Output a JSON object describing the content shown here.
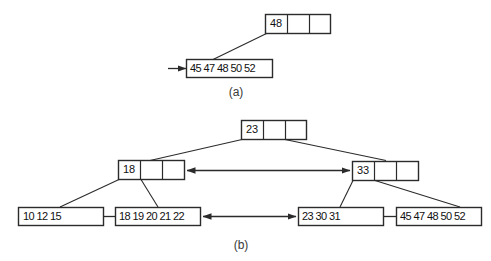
{
  "figure": {
    "background": "#ffffff",
    "line_color": "#2b2b2b",
    "text_color": "#111111",
    "caption_color": "#3a3a3a",
    "type": "b-plus-tree-diagram",
    "panels": [
      {
        "id": "a",
        "caption": "(a)",
        "levels": [
          {
            "role": "root",
            "nodes": [
              {
                "id": "a-root",
                "cells": [
                  "48",
                  "",
                  ""
                ],
                "keys": [
                  "48"
                ],
                "slots": 3
              }
            ]
          },
          {
            "role": "leaf",
            "nodes": [
              {
                "id": "a-leaf-1",
                "cells": [
                  "45",
                  "47",
                  "48",
                  "50",
                  "52"
                ],
                "keys": [
                  "45",
                  "47",
                  "48",
                  "50",
                  "52"
                ],
                "slots": 5,
                "inbound_arrow": "left"
              }
            ]
          }
        ],
        "edges": [
          {
            "from": "a-root",
            "from_slot": 0,
            "to": "a-leaf-1"
          }
        ]
      },
      {
        "id": "b",
        "caption": "(b)",
        "levels": [
          {
            "role": "root",
            "nodes": [
              {
                "id": "b-root",
                "cells": [
                  "23",
                  "",
                  ""
                ],
                "keys": [
                  "23"
                ],
                "slots": 3
              }
            ]
          },
          {
            "role": "internal",
            "nodes": [
              {
                "id": "b-internal-left",
                "cells": [
                  "18",
                  "",
                  ""
                ],
                "keys": [
                  "18"
                ],
                "slots": 3,
                "inbound_arrow": "right"
              },
              {
                "id": "b-internal-right",
                "cells": [
                  "33",
                  "",
                  ""
                ],
                "keys": [
                  "33"
                ],
                "slots": 3,
                "inbound_arrow": "left"
              }
            ]
          },
          {
            "role": "leaf",
            "nodes": [
              {
                "id": "b-leaf-1",
                "cells": [
                  "10",
                  "12",
                  "15"
                ],
                "keys": [
                  "10",
                  "12",
                  "15"
                ],
                "slots": 5
              },
              {
                "id": "b-leaf-2",
                "cells": [
                  "18",
                  "19",
                  "20",
                  "21",
                  "22"
                ],
                "keys": [
                  "18",
                  "19",
                  "20",
                  "21",
                  "22"
                ],
                "slots": 5,
                "inbound_arrow": "right"
              },
              {
                "id": "b-leaf-3",
                "cells": [
                  "23",
                  "30",
                  "31"
                ],
                "keys": [
                  "23",
                  "30",
                  "31"
                ],
                "slots": 5,
                "inbound_arrow": "left"
              },
              {
                "id": "b-leaf-4",
                "cells": [
                  "45",
                  "47",
                  "48",
                  "50",
                  "52"
                ],
                "keys": [
                  "45",
                  "47",
                  "48",
                  "50",
                  "52"
                ],
                "slots": 5
              }
            ]
          }
        ],
        "edges": [
          {
            "from": "b-root",
            "from_slot": 0,
            "to": "b-internal-left"
          },
          {
            "from": "b-root",
            "from_slot": 1,
            "to": "b-internal-right"
          },
          {
            "from": "b-internal-left",
            "from_slot": 0,
            "to": "b-leaf-1"
          },
          {
            "from": "b-internal-left",
            "from_slot": 1,
            "to": "b-leaf-2"
          },
          {
            "from": "b-internal-right",
            "from_slot": 0,
            "to": "b-leaf-3"
          },
          {
            "from": "b-internal-right",
            "from_slot": 1,
            "to": "b-leaf-4"
          }
        ],
        "sibling_links": [
          {
            "from": "b-internal-left",
            "to": "b-internal-right",
            "style": "double-arrow"
          },
          {
            "from": "b-leaf-2",
            "to": "b-leaf-3",
            "style": "double-arrow"
          },
          {
            "from": "b-leaf-1",
            "to": "b-leaf-2",
            "style": "plain-line"
          },
          {
            "from": "b-leaf-3",
            "to": "b-leaf-4",
            "style": "plain-line"
          }
        ]
      }
    ]
  },
  "labels": {
    "panel_a_caption": "(a)",
    "panel_b_caption": "(b)",
    "a_root_key": "48",
    "a_leaf_keys": "45 47 48 50 52",
    "b_root_key": "23",
    "b_internal_left_key": "18",
    "b_internal_right_key": "33",
    "b_leaf1_keys": "10 12 15",
    "b_leaf2_keys": "18 19 20 21 22",
    "b_leaf3_keys": "23 30 31",
    "b_leaf4_keys": "45 47 48 50 52"
  }
}
